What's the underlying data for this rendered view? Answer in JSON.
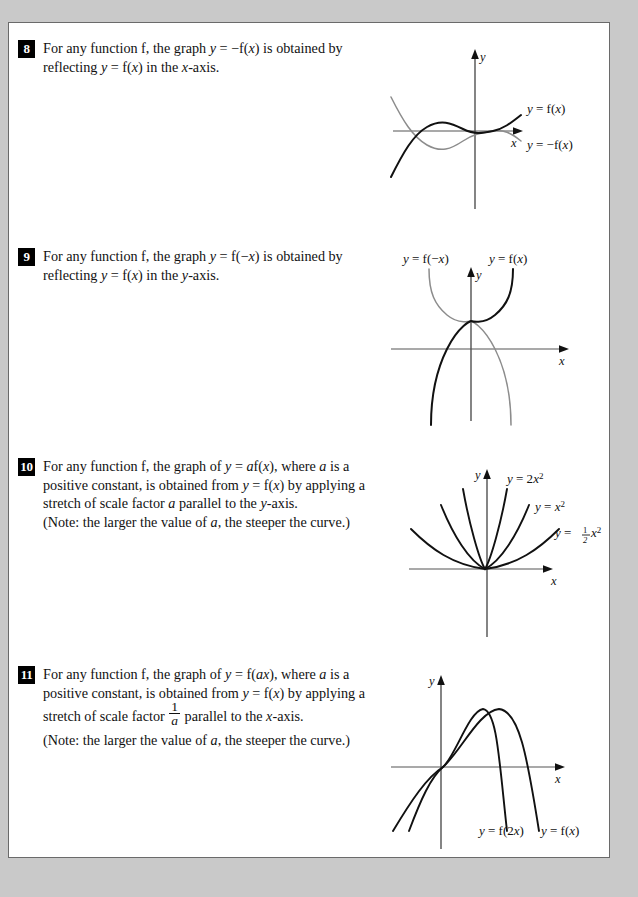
{
  "page": {
    "background_color": "#c9c9c9",
    "sheet_color": "#ffffff",
    "border_color": "#6a6a6a"
  },
  "items": [
    {
      "number": "8",
      "lines": [
        "For any function f, the graph y = −f(x) is obtained by",
        "reflecting y = f(x) in the x-axis."
      ],
      "graph": {
        "name": "reflection-in-x-axis-graph",
        "curve_labels": [
          "y = f(x)",
          "y = −f(x)"
        ],
        "axis_labels": [
          "y",
          "x"
        ],
        "description": "Cubic-like curve y = f(x) in black with its reflection y = −f(x) in grey below the x-axis"
      }
    },
    {
      "number": "9",
      "lines": [
        "For any function f, the graph y = f(−x) is obtained by",
        "reflecting y = f(x) in the y-axis."
      ],
      "graph": {
        "name": "reflection-in-y-axis-graph",
        "curve_labels": [
          "y = f(−x)",
          "y = f(x)"
        ],
        "axis_labels": [
          "y",
          "x"
        ],
        "description": "Two mirror-image S shaped curves crossing above the origin on the y-axis"
      }
    },
    {
      "number": "10",
      "lines": [
        "For any function f, the graph of y = af(x), where a is a",
        "positive constant, is obtained from y = f(x) by applying a",
        "stretch of scale factor a parallel to the y-axis.",
        "(Note: the larger the value of a, the steeper the curve.)"
      ],
      "graph": {
        "name": "vertical-stretch-graph",
        "curve_labels": [
          "y = 2x²",
          "y = x²",
          "y = ½x²"
        ],
        "axis_labels": [
          "y",
          "x"
        ],
        "description": "Three parabolas through the origin of increasing width: y = 2x squared, y = x squared, y = one half x squared"
      }
    },
    {
      "number": "11",
      "lines": [
        "For any function f, the graph of y = f(ax), where a is a",
        "positive constant, is obtained from y = f(x) by applying a",
        "stretch of scale factor  parallel to the x-axis.",
        "(Note: the larger the value of a, the steeper the curve.)"
      ],
      "fraction": {
        "numerator": "1",
        "denominator": "a"
      },
      "graph": {
        "name": "horizontal-stretch-graph",
        "curve_labels": [
          "y = f(2x)",
          "y = f(x)"
        ],
        "axis_labels": [
          "y",
          "x"
        ],
        "description": "Two downward opening parabolas through the origin, the narrower labelled y = f(2x) and the wider labelled y = f(x)"
      }
    }
  ]
}
